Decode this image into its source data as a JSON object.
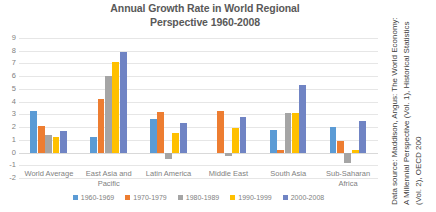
{
  "chart_data": {
    "type": "bar",
    "title": "Annual Growth Rate in World Regional Perspective 1960-2008",
    "title_lines": [
      "Annual Growth Rate in World Regional",
      "Perspective 1960-2008"
    ],
    "xlabel": "",
    "ylabel": "",
    "ylim": [
      -2,
      9
    ],
    "yticks": [
      9,
      8,
      7,
      6,
      5,
      4,
      3,
      2,
      1,
      0,
      -1,
      -2
    ],
    "ytick_labels": [
      "9",
      "8",
      "7",
      "6",
      "5",
      "4",
      "3",
      "2",
      "1",
      "0",
      "-1",
      "-2"
    ],
    "grid": true,
    "legend_position": "bottom",
    "categories": [
      "World Average",
      "East Asia and Pacific",
      "Latin America",
      "Middle East",
      "South Asia",
      "Sub-Saharan Africa"
    ],
    "category_lines": [
      [
        "World Average"
      ],
      [
        "East Asia and",
        "Pacific"
      ],
      [
        "Latin America"
      ],
      [
        "Middle East"
      ],
      [
        "South Asia"
      ],
      [
        "Sub-Saharan",
        "Africa"
      ]
    ],
    "series": [
      {
        "name": "1960-1969",
        "color": "#5B9BD5",
        "values": [
          3.3,
          1.2,
          2.6,
          null,
          1.8,
          2.0
        ]
      },
      {
        "name": "1970-1979",
        "color": "#ED7D31",
        "values": [
          2.1,
          4.2,
          3.2,
          3.3,
          0.2,
          0.9
        ]
      },
      {
        "name": "1980-1989",
        "color": "#A5A5A5",
        "values": [
          1.4,
          6.0,
          -0.5,
          -0.3,
          3.1,
          -0.8
        ]
      },
      {
        "name": "1990-1999",
        "color": "#FFC000",
        "values": [
          1.2,
          7.1,
          1.5,
          1.9,
          3.1,
          0.2
        ]
      },
      {
        "name": "2000-2008",
        "color": "#7084C4",
        "values": [
          1.7,
          7.9,
          2.3,
          2.8,
          5.3,
          2.5
        ]
      }
    ]
  },
  "source_note": {
    "lines": [
      "Data source: Maddison, Angus: The World Economy:",
      "A Millennial Perspective (Vol. 1), Historical Statistics",
      "(Vol. 2), OECD 200"
    ]
  },
  "colors": {
    "series_1960_1969": "#5B9BD5",
    "series_1970_1979": "#ED7D31",
    "series_1980_1989": "#A5A5A5",
    "series_1990_1999": "#FFC000",
    "series_2000_2008": "#7084C4",
    "gridline": "#e6e6e6",
    "text": "#7f7f7f",
    "title_text": "#595959"
  }
}
